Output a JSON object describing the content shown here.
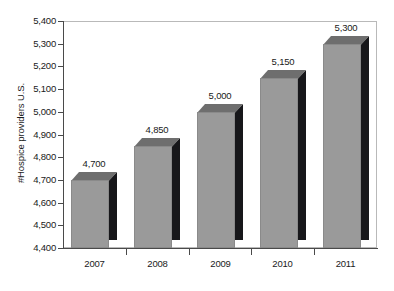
{
  "chart_data": {
    "type": "bar",
    "title": "",
    "subtitle": "",
    "xlabel": "",
    "ylabel": "#Hospice providers U.S.",
    "categories": [
      "2007",
      "2008",
      "2009",
      "2010",
      "2011"
    ],
    "values": [
      4700,
      4850,
      5000,
      5150,
      5300
    ],
    "value_labels": [
      "4,700",
      "4,850",
      "5,000",
      "5,150",
      "5,300"
    ],
    "ylim": [
      4400,
      5400
    ],
    "ytick_values": [
      5400,
      5300,
      5200,
      5100,
      5000,
      4900,
      4800,
      4700,
      4600,
      4500,
      4400
    ],
    "ytick_labels": [
      "5,400",
      "5,300",
      "5,200",
      "5,100",
      "5,000",
      "4,900",
      "4,800",
      "4,700",
      "4,600",
      "4,500",
      "4,400"
    ],
    "grid": false,
    "legend": null,
    "style": "3d-column",
    "colors": {
      "bar_front": "#9a9a9a",
      "bar_top": "#6e6e6e",
      "bar_side": "#17171a",
      "axis": "#4a4a4a",
      "frame": "#b9b9b9",
      "text": "#1a1a1a",
      "background": "#ffffff"
    }
  }
}
